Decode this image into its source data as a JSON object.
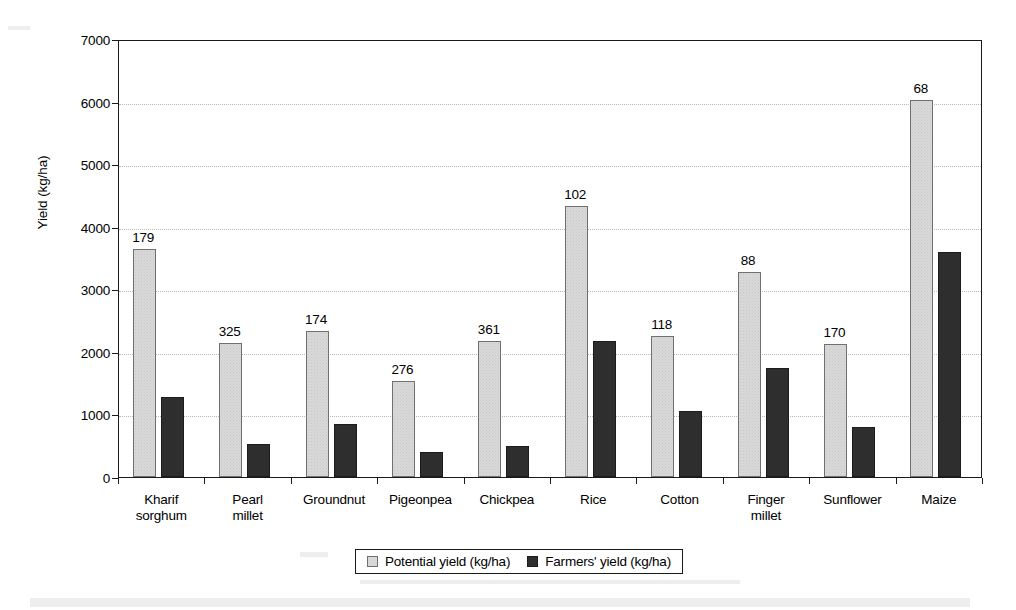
{
  "chart_data": {
    "type": "bar",
    "title": "",
    "xlabel": "",
    "ylabel": "Yield (kg/ha)",
    "ylim": [
      0,
      7000
    ],
    "yticks": [
      0,
      1000,
      2000,
      3000,
      4000,
      5000,
      6000,
      7000
    ],
    "ytick_labels": [
      "0",
      "1000",
      "2000",
      "3000",
      "4000",
      "5000",
      "6000",
      "7000"
    ],
    "grid": true,
    "grid_axis": "y",
    "legend_position": "bottom-center",
    "categories": [
      "Kharif\nsorghum",
      "Pearl\nmillet",
      "Groundnut",
      "Pigeonpea",
      "Chickpea",
      "Rice",
      "Cotton",
      "Finger\nmillet",
      "Sunflower",
      "Maize"
    ],
    "series": [
      {
        "name": "Potential yield (kg/ha)",
        "color": "#d8d8d8",
        "values": [
          3640,
          2140,
          2330,
          1530,
          2170,
          4330,
          2260,
          3280,
          2130,
          6020
        ]
      },
      {
        "name": "Farmers' yield (kg/ha)",
        "color": "#2e2e2e",
        "values": [
          1280,
          520,
          850,
          400,
          490,
          2170,
          1050,
          1740,
          800,
          3600
        ]
      }
    ],
    "annotations": [
      "179",
      "325",
      "174",
      "276",
      "361",
      "102",
      "118",
      "88",
      "170",
      "68"
    ],
    "annotation_note": "value printed above each potential-yield bar"
  }
}
